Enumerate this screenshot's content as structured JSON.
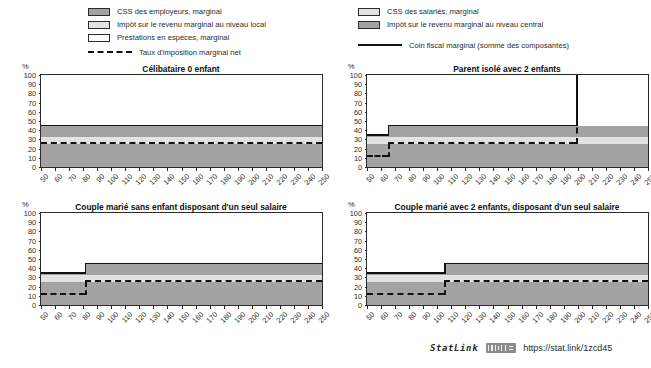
{
  "legend": {
    "left_items": [
      {
        "label": "CSS des employeurs, marginal",
        "swatch": "swatch-dark-grey"
      },
      {
        "label": "Impôt sur le revenu marginal au niveau local",
        "swatch": "swatch-light-grey"
      },
      {
        "label": "Prestations en espèces, marginal",
        "swatch": "swatch-white"
      }
    ],
    "left_line": {
      "label": "Taux d'imposition marginal net",
      "style": "dashed-black"
    },
    "right_items": [
      {
        "label": "CSS des salariés, marginal",
        "swatch": "swatch-light-grey"
      },
      {
        "label": "Impôt sur le revenu marginal au niveau central",
        "swatch": "swatch-dark-grey"
      }
    ],
    "right_line": {
      "label": "Coin fiscal marginal (somme des composantes)",
      "style": "solid-black"
    }
  },
  "axis": {
    "y_unit": "%",
    "y_ticks": [
      0,
      10,
      20,
      30,
      40,
      50,
      60,
      70,
      80,
      90,
      100
    ],
    "y_min": 0,
    "y_max": 100,
    "x_ticks": [
      50,
      60,
      70,
      80,
      90,
      100,
      110,
      120,
      130,
      140,
      150,
      160,
      170,
      180,
      190,
      200,
      210,
      220,
      230,
      240,
      250
    ],
    "x_min": 50,
    "x_max": 250
  },
  "colors": {
    "dark_grey": "#a3a3a3",
    "light_grey": "#e2e2e2",
    "white": "#ffffff",
    "line": "#111111",
    "axis": "#2b2b2b"
  },
  "footer": {
    "statlink_label": "StatLink",
    "url": "https://stat.link/1zcd45",
    "logo": "statlink-barcode-icon"
  },
  "chart_data": [
    {
      "type": "area",
      "id": "panel-celibataire-0-enfant",
      "title": "Célibataire 0 enfant",
      "xlabel": "",
      "ylabel": "%",
      "xlim": [
        50,
        250
      ],
      "ylim": [
        0,
        100
      ],
      "grid": false,
      "x_breakpoints": [
        50,
        250
      ],
      "series": [
        {
          "name": "CSS des employeurs, marginal",
          "values": [
            25.5,
            25.5
          ]
        },
        {
          "name": "CSS des salariés, marginal",
          "values": [
            7.0,
            7.0
          ]
        },
        {
          "name": "Impôt sur le revenu marginal au niveau central",
          "values": [
            12.0,
            12.0
          ]
        },
        {
          "name": "Impôt sur le revenu marginal au niveau local",
          "values": [
            0.0,
            0.0
          ]
        },
        {
          "name": "Prestations en espèces, marginal",
          "values": [
            0.0,
            0.0
          ]
        }
      ],
      "lines": [
        {
          "name": "Coin fiscal marginal (somme des composantes)",
          "style": "solid",
          "values": [
            44.5,
            44.5
          ]
        },
        {
          "name": "Taux d'imposition marginal net",
          "style": "dashed",
          "values": [
            25.5,
            25.5
          ]
        }
      ]
    },
    {
      "type": "area",
      "id": "panel-parent-isole-2-enfants",
      "title": "Parent isolé avec 2 enfants",
      "xlabel": "",
      "ylabel": "%",
      "xlim": [
        50,
        250
      ],
      "ylim": [
        0,
        100
      ],
      "grid": false,
      "x_breakpoints": [
        50,
        65,
        198,
        199,
        250
      ],
      "series": [
        {
          "name": "CSS des employeurs, marginal",
          "values": [
            25.5,
            25.5,
            25.5,
            25.5,
            25.5
          ]
        },
        {
          "name": "CSS des salariés, marginal",
          "values": [
            7.0,
            7.0,
            7.0,
            7.0,
            7.0
          ]
        },
        {
          "name": "Impôt sur le revenu marginal au niveau central",
          "values": [
            1.5,
            12.0,
            12.0,
            12.0,
            12.0
          ]
        },
        {
          "name": "Impôt sur le revenu marginal au niveau local",
          "values": [
            0.0,
            0.0,
            0.0,
            0.0,
            0.0
          ]
        },
        {
          "name": "Prestations en espèces, marginal",
          "values": [
            0.0,
            0.0,
            0.0,
            55.5,
            0.0
          ]
        }
      ],
      "lines": [
        {
          "name": "Coin fiscal marginal (somme des composantes)",
          "style": "solid",
          "values": [
            34.0,
            44.5,
            44.5,
            100.0,
            44.5
          ]
        },
        {
          "name": "Taux d'imposition marginal net",
          "style": "dashed",
          "values": [
            10.5,
            25.5,
            25.5,
            100.0,
            25.5
          ]
        }
      ],
      "annotations": [
        {
          "text": "spike to 100% at approx. 198",
          "x": 198
        }
      ]
    },
    {
      "type": "area",
      "id": "panel-couple-marie-sans-enfant",
      "title": "Couple marié sans enfant disposant d'un seul salaire",
      "xlabel": "",
      "ylabel": "%",
      "xlim": [
        50,
        250
      ],
      "ylim": [
        0,
        100
      ],
      "grid": false,
      "x_breakpoints": [
        50,
        81,
        250
      ],
      "series": [
        {
          "name": "CSS des employeurs, marginal",
          "values": [
            25.5,
            25.5,
            25.5
          ]
        },
        {
          "name": "CSS des salariés, marginal",
          "values": [
            7.0,
            7.0,
            7.0
          ]
        },
        {
          "name": "Impôt sur le revenu marginal au niveau central",
          "values": [
            1.5,
            12.0,
            12.0
          ]
        },
        {
          "name": "Impôt sur le revenu marginal au niveau local",
          "values": [
            0.0,
            0.0,
            0.0
          ]
        },
        {
          "name": "Prestations en espèces, marginal",
          "values": [
            0.0,
            0.0,
            0.0
          ]
        }
      ],
      "lines": [
        {
          "name": "Coin fiscal marginal (somme des composantes)",
          "style": "solid",
          "values": [
            34.0,
            44.5,
            44.5
          ]
        },
        {
          "name": "Taux d'imposition marginal net",
          "style": "dashed",
          "values": [
            10.5,
            25.5,
            25.5
          ]
        }
      ]
    },
    {
      "type": "area",
      "id": "panel-couple-marie-2-enfants",
      "title": "Couple marié avec 2 enfants, disposant d'un seul salaire",
      "xlabel": "",
      "ylabel": "%",
      "xlim": [
        50,
        250
      ],
      "ylim": [
        0,
        100
      ],
      "grid": false,
      "x_breakpoints": [
        50,
        105,
        250
      ],
      "series": [
        {
          "name": "CSS des employeurs, marginal",
          "values": [
            25.5,
            25.5,
            25.5
          ]
        },
        {
          "name": "CSS des salariés, marginal",
          "values": [
            7.0,
            7.0,
            7.0
          ]
        },
        {
          "name": "Impôt sur le revenu marginal au niveau central",
          "values": [
            1.5,
            12.0,
            12.0
          ]
        },
        {
          "name": "Impôt sur le revenu marginal au niveau local",
          "values": [
            0.0,
            0.0,
            0.0
          ]
        },
        {
          "name": "Prestations en espèces, marginal",
          "values": [
            0.0,
            0.0,
            0.0
          ]
        }
      ],
      "lines": [
        {
          "name": "Coin fiscal marginal (somme des composantes)",
          "style": "solid",
          "values": [
            34.0,
            44.5,
            44.5
          ]
        },
        {
          "name": "Taux d'imposition marginal net",
          "style": "dashed",
          "values": [
            10.5,
            25.5,
            25.5
          ]
        }
      ]
    }
  ]
}
